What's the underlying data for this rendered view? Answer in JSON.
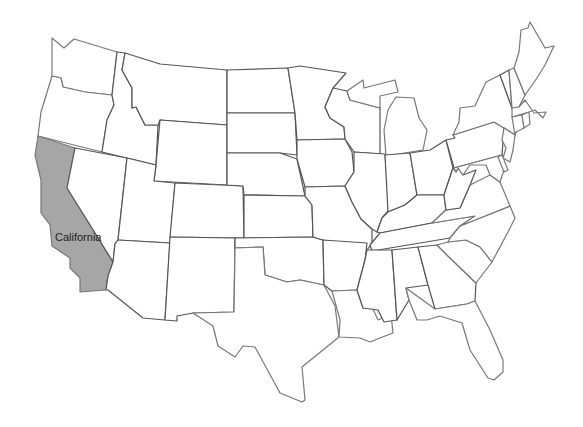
{
  "map": {
    "type": "choropleth-outline",
    "region": "Contiguous United States",
    "highlighted_states": [
      {
        "name": "California",
        "label": "California",
        "fill": "#a6a6a6"
      }
    ],
    "default_fill": "#ffffff",
    "border_color": "#555555"
  }
}
